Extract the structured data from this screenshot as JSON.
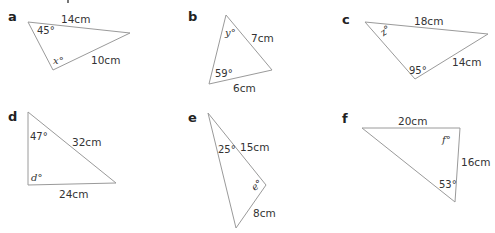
{
  "figure": {
    "type": "triangle-exercises",
    "stroke_color": "#9a9a9a",
    "text_color": "#333333",
    "triangles": [
      {
        "id": "a",
        "label": "a",
        "vertices": [
          [
            28,
            22
          ],
          [
            130,
            33
          ],
          [
            53,
            70
          ]
        ],
        "sides": [
          {
            "text": "14cm"
          },
          {
            "text": "10cm"
          }
        ],
        "angles": [
          {
            "text": "45°"
          },
          {
            "text": "x°",
            "unknown": "x"
          }
        ]
      },
      {
        "id": "b",
        "label": "b",
        "vertices": [
          [
            226,
            15
          ],
          [
            272,
            70
          ],
          [
            209,
            84
          ]
        ],
        "sides": [
          {
            "text": "7cm"
          },
          {
            "text": "6cm"
          }
        ],
        "angles": [
          {
            "text": "y°",
            "unknown": "y"
          },
          {
            "text": "59°"
          }
        ]
      },
      {
        "id": "c",
        "label": "c",
        "vertices": [
          [
            365,
            22
          ],
          [
            488,
            34
          ],
          [
            415,
            79
          ]
        ],
        "sides": [
          {
            "text": "18cm"
          },
          {
            "text": "14cm"
          }
        ],
        "angles": [
          {
            "text": "z°",
            "unknown": "z"
          },
          {
            "text": "95°"
          }
        ]
      },
      {
        "id": "d",
        "label": "d",
        "vertices": [
          [
            28,
            112
          ],
          [
            116,
            183
          ],
          [
            28,
            185
          ]
        ],
        "sides": [
          {
            "text": "32cm"
          },
          {
            "text": "24cm"
          }
        ],
        "angles": [
          {
            "text": "47°"
          },
          {
            "text": "d°",
            "unknown": "d"
          }
        ]
      },
      {
        "id": "e",
        "label": "e",
        "vertices": [
          [
            208,
            113
          ],
          [
            266,
            185
          ],
          [
            236,
            228
          ]
        ],
        "sides": [
          {
            "text": "15cm"
          },
          {
            "text": "8cm"
          }
        ],
        "angles": [
          {
            "text": "25°"
          },
          {
            "text": "e°",
            "unknown": "e"
          }
        ]
      },
      {
        "id": "f",
        "label": "f",
        "vertices": [
          [
            362,
            128
          ],
          [
            460,
            128
          ],
          [
            455,
            202
          ]
        ],
        "sides": [
          {
            "text": "20cm"
          },
          {
            "text": "16cm"
          }
        ],
        "angles": [
          {
            "text": "f°",
            "unknown": "f"
          },
          {
            "text": "53°"
          }
        ]
      }
    ]
  }
}
